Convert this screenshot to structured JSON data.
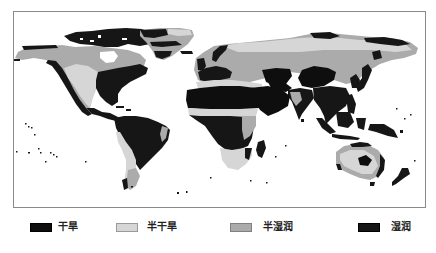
{
  "figure": {
    "kind": "world climate zone map",
    "frame": {
      "x": 13,
      "y": 11,
      "width": 412,
      "height": 196
    }
  },
  "colors": {
    "arid": "#0e0e0e",
    "semi_arid": "#d6d6d6",
    "semi_humid": "#ababab",
    "humid": "#161616",
    "background": "#ffffff"
  },
  "map": {
    "regions": [
      {
        "name": "North America north (Canada/Alaska)",
        "category": "semi_humid"
      },
      {
        "name": "Arctic archipelago",
        "category": "humid"
      },
      {
        "name": "North America west coast",
        "category": "humid"
      },
      {
        "name": "Great Plains / western US",
        "category": "semi_arid"
      },
      {
        "name": "Eastern North America",
        "category": "humid"
      },
      {
        "name": "Central America",
        "category": "humid"
      },
      {
        "name": "Greenland",
        "category": "semi_humid"
      },
      {
        "name": "Northern Siberia",
        "category": "semi_arid"
      },
      {
        "name": "Russia / Siberia",
        "category": "semi_humid"
      },
      {
        "name": "Western Europe",
        "category": "humid"
      },
      {
        "name": "Mediterranean",
        "category": "semi_arid"
      },
      {
        "name": "Central Asia deserts",
        "category": "arid"
      },
      {
        "name": "Gobi / Tibet",
        "category": "arid"
      },
      {
        "name": "East & Southeast Asia",
        "category": "humid"
      },
      {
        "name": "Sahara",
        "category": "arid"
      },
      {
        "name": "Arabian Peninsula",
        "category": "arid"
      },
      {
        "name": "Sahel",
        "category": "semi_arid"
      },
      {
        "name": "Central Africa",
        "category": "humid"
      },
      {
        "name": "Southern Africa",
        "category": "semi_arid"
      },
      {
        "name": "India",
        "category": "humid"
      },
      {
        "name": "Maritime Southeast Asia",
        "category": "humid"
      },
      {
        "name": "Australia interior",
        "category": "semi_arid"
      },
      {
        "name": "Central Australia",
        "category": "arid"
      },
      {
        "name": "South America (Amazon)",
        "category": "humid"
      },
      {
        "name": "Andes / west coast",
        "category": "semi_arid"
      },
      {
        "name": "New Zealand",
        "category": "humid"
      }
    ]
  },
  "legend": {
    "items": [
      {
        "key": "arid",
        "label": "干旱"
      },
      {
        "key": "semi_arid",
        "label": "半干旱"
      },
      {
        "key": "semi_humid",
        "label": "半湿润"
      },
      {
        "key": "humid",
        "label": "湿润"
      }
    ]
  }
}
